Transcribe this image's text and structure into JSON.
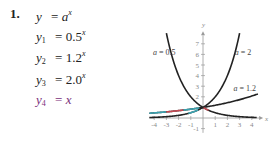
{
  "problem": {
    "number": "1.",
    "equations": [
      {
        "lhs_var": "y",
        "lhs_sub": "",
        "op": "=",
        "base": "a",
        "exp": "x",
        "color": "#222222"
      },
      {
        "lhs_var": "y",
        "lhs_sub": "1",
        "op": "=",
        "base": "0.5",
        "exp": "x",
        "color": "#222222"
      },
      {
        "lhs_var": "y",
        "lhs_sub": "2",
        "op": "=",
        "base": "1.2",
        "exp": "x",
        "color": "#222222"
      },
      {
        "lhs_var": "y",
        "lhs_sub": "3",
        "op": "=",
        "base": "2.0",
        "exp": "x",
        "color": "#222222"
      },
      {
        "lhs_var": "y",
        "lhs_sub": "4",
        "op": "=",
        "base": "x",
        "exp": "",
        "color": "#7a2f7a"
      }
    ]
  },
  "chart_data": {
    "type": "line",
    "title": "",
    "xlabel": "x",
    "ylabel": "y",
    "xlim": [
      -4.4,
      4.6
    ],
    "ylim": [
      -1.4,
      7.8
    ],
    "x_ticks": [
      -4,
      -3,
      -2,
      -1,
      1,
      2,
      3,
      4
    ],
    "x_tick_labels": [
      "-4",
      "-3",
      "-2",
      "-1",
      "1",
      "2",
      "3",
      "4"
    ],
    "y_ticks": [
      -1,
      2,
      3,
      4,
      5,
      6,
      7
    ],
    "y_tick_labels": [
      "-1",
      "2",
      "3",
      "4",
      "5",
      "6",
      "7"
    ],
    "grid": false,
    "series": [
      {
        "name": "a = 0.5",
        "function": "0.5^x",
        "base": 0.5,
        "x_range": [
          -3.0,
          4.4
        ],
        "color": "#222222"
      },
      {
        "name": "a = 2",
        "function": "2^x",
        "base": 2.0,
        "x_range": [
          -4.4,
          3.0
        ],
        "color": "#222222"
      },
      {
        "name": "a = 1.2",
        "function": "1.2^x",
        "base": 1.2,
        "x_range": [
          -4.4,
          4.5
        ],
        "color": "#222222"
      }
    ],
    "highlight_segments": [
      {
        "on_series": "a = 1.2",
        "x_range": [
          -4.4,
          -3.0
        ],
        "color": "#3fb8c8"
      },
      {
        "on_series": "a = 1.2",
        "x_range": [
          -3.0,
          -1.6
        ],
        "color": "#e0505a"
      },
      {
        "on_series": "a = 1.2",
        "x_range": [
          -1.6,
          -0.3
        ],
        "color": "#3fb8c8"
      },
      {
        "on_series": "a = 0.5",
        "x_range": [
          0.05,
          0.45
        ],
        "color": "#e0505a"
      },
      {
        "on_series": "a = 2",
        "x_range": [
          -1.2,
          -0.4
        ],
        "color": "#3fb8c8"
      }
    ],
    "annotations": [
      {
        "text": "a = 0.5",
        "near_series": "a = 0.5",
        "position": "upper-left"
      },
      {
        "text": "a = 2",
        "near_series": "a = 2",
        "position": "upper-right"
      },
      {
        "text": "a = 1.2",
        "near_series": "a = 1.2",
        "position": "right"
      }
    ]
  }
}
